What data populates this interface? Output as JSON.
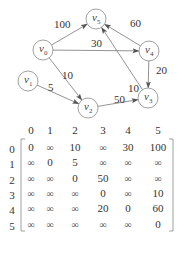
{
  "graph": {
    "nodes": [
      {
        "id": "v0",
        "base": "v",
        "sub": "0",
        "x": 43,
        "y": 50
      },
      {
        "id": "v1",
        "base": "v",
        "sub": "1",
        "x": 28,
        "y": 81
      },
      {
        "id": "v2",
        "base": "v",
        "sub": "2",
        "x": 88,
        "y": 108
      },
      {
        "id": "v3",
        "base": "v",
        "sub": "3",
        "x": 148,
        "y": 98
      },
      {
        "id": "v4",
        "base": "v",
        "sub": "4",
        "x": 149,
        "y": 51
      },
      {
        "id": "v5",
        "base": "v",
        "sub": "5",
        "x": 96,
        "y": 19
      }
    ],
    "edges": [
      {
        "from": "v0",
        "to": "v5",
        "weight": "100"
      },
      {
        "from": "v0",
        "to": "v4",
        "weight": "30"
      },
      {
        "from": "v0",
        "to": "v2",
        "weight": "10"
      },
      {
        "from": "v1",
        "to": "v2",
        "weight": "5"
      },
      {
        "from": "v2",
        "to": "v3",
        "weight": "50"
      },
      {
        "from": "v3",
        "to": "v5",
        "weight": "10"
      },
      {
        "from": "v4",
        "to": "v5",
        "weight": "60"
      },
      {
        "from": "v4",
        "to": "v3",
        "weight": "20"
      }
    ]
  },
  "matrix": {
    "column_headers": [
      "0",
      "1",
      "2",
      "3",
      "4",
      "5"
    ],
    "row_headers": [
      "0",
      "1",
      "2",
      "3",
      "4",
      "5"
    ],
    "rows": [
      [
        "0",
        "∞",
        "10",
        "∞",
        "30",
        "100"
      ],
      [
        "∞",
        "0",
        "5",
        "∞",
        "∞",
        "∞"
      ],
      [
        "∞",
        "∞",
        "0",
        "50",
        "∞",
        "∞"
      ],
      [
        "∞",
        "∞",
        "∞",
        "0",
        "∞",
        "10"
      ],
      [
        "∞",
        "∞",
        "∞",
        "20",
        "0",
        "60"
      ],
      [
        "∞",
        "∞",
        "∞",
        "∞",
        "∞",
        "0"
      ]
    ]
  }
}
